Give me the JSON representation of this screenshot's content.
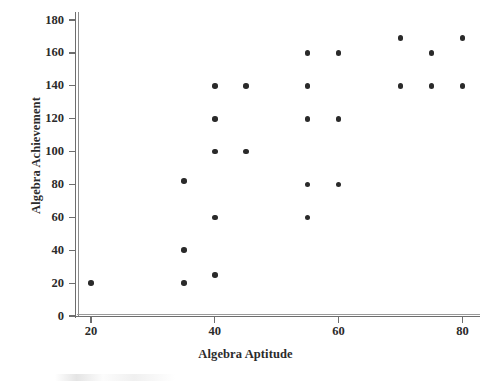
{
  "chart_data": {
    "type": "scatter",
    "title": "",
    "xlabel": "Algebra Aptitude",
    "ylabel": "Algebra Achievement",
    "xlim": [
      15,
      83
    ],
    "ylim": [
      0,
      190
    ],
    "xticks": [
      20,
      40,
      60,
      80
    ],
    "yticks": [
      0,
      20,
      40,
      60,
      80,
      100,
      120,
      140,
      160,
      180
    ],
    "xtick_labels": [
      "20",
      "40",
      "60",
      "80"
    ],
    "ytick_labels": [
      "0",
      "20",
      "40",
      "60",
      "80",
      "100",
      "120",
      "140",
      "160",
      "180"
    ],
    "grid": false,
    "legend": null,
    "marker": "filled-circle",
    "marker_color": "#2a2a2a",
    "axis_color": "#6e6e6e",
    "background": "#ffffff",
    "n_points": 25,
    "points": [
      {
        "x": 20,
        "y": 20
      },
      {
        "x": 35,
        "y": 82
      },
      {
        "x": 35,
        "y": 40
      },
      {
        "x": 35,
        "y": 20
      },
      {
        "x": 40,
        "y": 140
      },
      {
        "x": 40,
        "y": 120
      },
      {
        "x": 40,
        "y": 100
      },
      {
        "x": 40,
        "y": 60
      },
      {
        "x": 40,
        "y": 25
      },
      {
        "x": 45,
        "y": 140
      },
      {
        "x": 45,
        "y": 100
      },
      {
        "x": 55,
        "y": 160
      },
      {
        "x": 55,
        "y": 140
      },
      {
        "x": 55,
        "y": 120
      },
      {
        "x": 55,
        "y": 80
      },
      {
        "x": 55,
        "y": 60
      },
      {
        "x": 60,
        "y": 160
      },
      {
        "x": 60,
        "y": 120
      },
      {
        "x": 60,
        "y": 80
      },
      {
        "x": 70,
        "y": 169
      },
      {
        "x": 70,
        "y": 140
      },
      {
        "x": 75,
        "y": 160
      },
      {
        "x": 75,
        "y": 140
      },
      {
        "x": 80,
        "y": 169
      },
      {
        "x": 80,
        "y": 140
      }
    ]
  }
}
